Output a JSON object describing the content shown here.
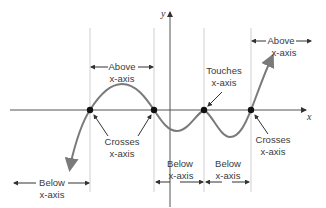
{
  "axes": {
    "x_label": "x",
    "y_label": "y"
  },
  "regions": {
    "above_left": {
      "line1": "Above",
      "line2": "x-axis"
    },
    "above_right": {
      "line1": "Above",
      "line2": "x-axis"
    },
    "below_left": {
      "line1": "Below",
      "line2": "x-axis"
    },
    "below_mid1": {
      "line1": "Below",
      "line2": "x-axis"
    },
    "below_mid2": {
      "line1": "Below",
      "line2": "x-axis"
    }
  },
  "annotations": {
    "crosses_left": {
      "line1": "Crosses",
      "line2": "x-axis"
    },
    "touches": {
      "line1": "Touches",
      "line2": "x-axis"
    },
    "crosses_right": {
      "line1": "Crosses",
      "line2": "x-axis"
    }
  },
  "colors": {
    "curve": "#7a7a7a",
    "axis": "#555555",
    "guide": "#cfcfcf",
    "point": "#111111"
  }
}
